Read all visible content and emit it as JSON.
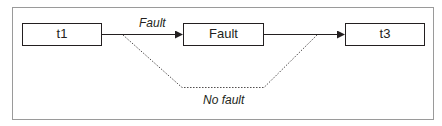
{
  "diagram": {
    "nodes": [
      {
        "id": "t1",
        "label": "t1"
      },
      {
        "id": "fault",
        "label": "Fault"
      },
      {
        "id": "t3",
        "label": "t3"
      }
    ],
    "edges": [
      {
        "from": "t1",
        "to": "fault",
        "label": "Fault",
        "style": "solid"
      },
      {
        "from": "fault",
        "to": "t3",
        "label": "",
        "style": "solid"
      },
      {
        "from": "t1",
        "to": "t3",
        "label": "No fault",
        "style": "dotted"
      }
    ],
    "colors": {
      "stroke": "#231f20",
      "frame": "#9a9a9a",
      "background": "#ffffff"
    }
  }
}
